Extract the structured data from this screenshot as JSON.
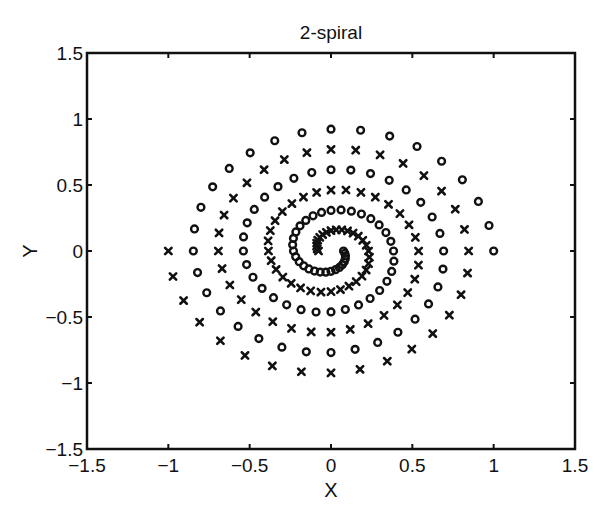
{
  "chart_data": {
    "type": "scatter",
    "title": "2-spiral",
    "xlabel": "X",
    "ylabel": "Y",
    "xlim": [
      -1.5,
      1.5
    ],
    "ylim": [
      -1.5,
      1.5
    ],
    "xticks": [
      -1.5,
      -1,
      -0.5,
      0,
      0.5,
      1,
      1.5
    ],
    "yticks": [
      -1.5,
      -1,
      -0.5,
      0,
      0.5,
      1,
      1.5
    ],
    "xtick_labels": [
      "−1.5",
      "−1",
      "−0.5",
      "0",
      "0.5",
      "1",
      "1.5"
    ],
    "ytick_labels": [
      "−1.5",
      "−1",
      "−0.5",
      "0",
      "0.5",
      "1",
      "1.5"
    ],
    "grid": false,
    "legend": null,
    "generator": {
      "points_per_series": 97,
      "radius_formula": "r_i = (104 - i) / 104",
      "angle_formula": "theta_i = i * pi / 16",
      "series_o": "x = r cos(theta), y = r sin(theta)",
      "series_x": "x = -r cos(theta), y = -r sin(theta)"
    },
    "series": [
      {
        "name": "spiral 1",
        "marker": "o",
        "color": "#111111"
      },
      {
        "name": "spiral 2",
        "marker": "x",
        "color": "#111111"
      }
    ]
  },
  "plot_area": {
    "left": 87,
    "right": 575,
    "top": 53,
    "bottom": 449
  }
}
